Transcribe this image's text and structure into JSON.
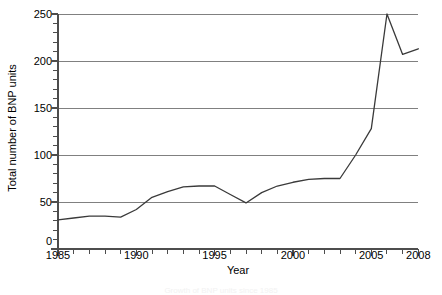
{
  "chart_data": {
    "type": "line",
    "title": "",
    "xlabel": "Year",
    "ylabel": "Total number of BNP units",
    "xlim": [
      1985,
      2008
    ],
    "ylim": [
      0,
      250
    ],
    "grid": true,
    "legend": null,
    "xticks": [
      1985,
      1990,
      1995,
      2000,
      2005,
      2008
    ],
    "xtick_labels": [
      "1985",
      "1990",
      "1995",
      "2000",
      "2005",
      "2008"
    ],
    "xtick_minor_step": 1,
    "yticks": [
      0,
      50,
      100,
      150,
      200,
      250
    ],
    "ytick_labels": [
      "0",
      "50",
      "100",
      "150",
      "200",
      "250"
    ],
    "ytick_minor_step": 10,
    "line_color": "#3a3a3a",
    "grid_color": "#808080",
    "axis_color": "#4d4d4d",
    "series": [
      {
        "name": "Total number of BNP units",
        "x": [
          1985,
          1986,
          1987,
          1988,
          1989,
          1990,
          1991,
          1992,
          1993,
          1994,
          1995,
          1996,
          1997,
          1998,
          1999,
          2000,
          2001,
          2002,
          2003,
          2004,
          2005,
          2006,
          2007,
          2008
        ],
        "values": [
          31,
          33,
          35,
          35,
          34,
          42,
          55,
          61,
          66,
          67,
          67,
          58,
          49,
          60,
          67,
          71,
          74,
          75,
          75,
          100,
          128,
          250,
          207,
          213
        ]
      }
    ]
  },
  "caption": {
    "text": "Growth of BNP units since 1985"
  }
}
